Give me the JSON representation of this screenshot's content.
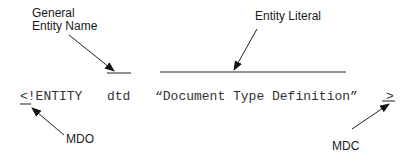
{
  "diagram": {
    "type": "annotated-syntax",
    "declaration": {
      "mdo": "<!ENTITY",
      "name": "dtd",
      "literal": "“Document Type Definition”",
      "mdc": ">"
    },
    "callouts": {
      "general_entity_name": {
        "line1": "General",
        "line2": "Entity Name"
      },
      "entity_literal": "Entity Literal",
      "mdo": "MDO",
      "mdc": "MDC"
    },
    "colors": {
      "background": "#ffffff",
      "text": "#1a1a1a",
      "code": "#333333",
      "lines": "#222222"
    }
  }
}
